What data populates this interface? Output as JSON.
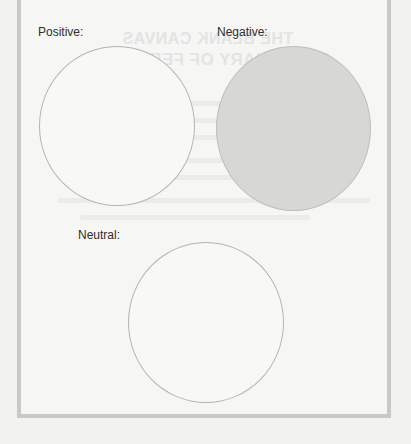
{
  "worksheet": {
    "sections": [
      {
        "id": "positive",
        "label": "Positive:",
        "fill": "#f8f8f7",
        "filled": false
      },
      {
        "id": "negative",
        "label": "Negative:",
        "fill": "#d7d7d6",
        "filled": true
      },
      {
        "id": "neutral",
        "label": "Neutral:",
        "fill": "#f8f8f7",
        "filled": false
      }
    ]
  },
  "bleed_through": {
    "line1": "THE BLANK CANVAS",
    "line2": "DICTIONARY OF FEELINGS"
  },
  "colors": {
    "frame_border": "#c9c9c8",
    "paper": "#f6f6f5",
    "label_text": "#2f2f2f",
    "circle_stroke": "#b4b4b4"
  }
}
